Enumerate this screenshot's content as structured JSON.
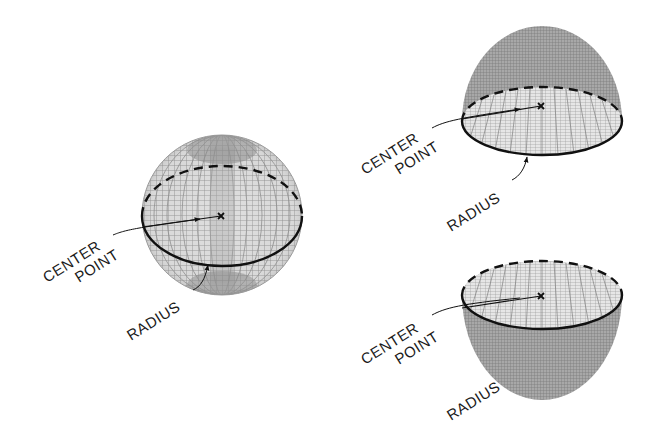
{
  "figures": [
    {
      "id": "sphere",
      "shape": "sphere",
      "center_label_line1": "CENTER",
      "center_label_line2": "POINT",
      "radius_label": "RADIUS"
    },
    {
      "id": "dome",
      "shape": "upper-hemisphere",
      "center_label_line1": "CENTER",
      "center_label_line2": "POINT",
      "radius_label": "RADIUS"
    },
    {
      "id": "bowl",
      "shape": "lower-hemisphere",
      "center_label_line1": "CENTER",
      "center_label_line2": "POINT",
      "radius_label": "RADIUS"
    }
  ],
  "colors": {
    "mesh": "#8a8a8a",
    "mesh_dark": "#6f6f6f",
    "outline": "#111111",
    "background": "#ffffff"
  }
}
